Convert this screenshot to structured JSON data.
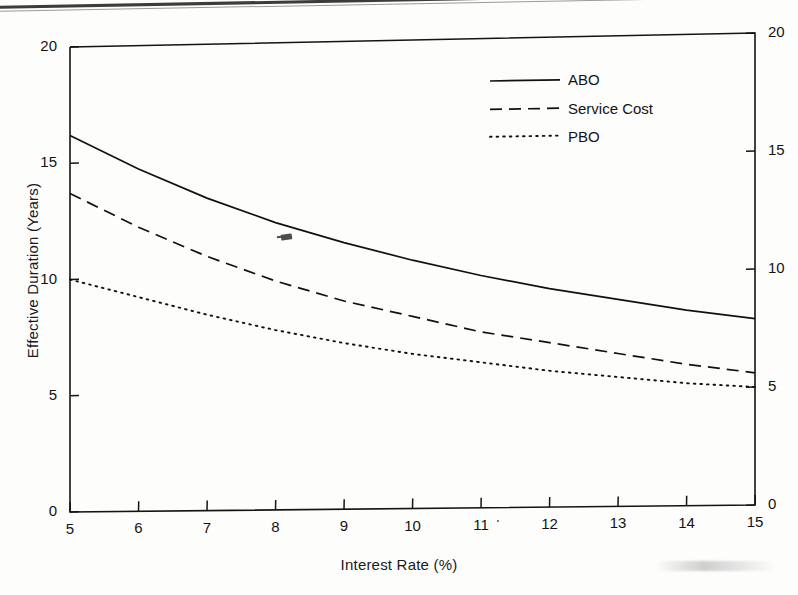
{
  "chart_data": {
    "type": "line",
    "title": "",
    "xlabel": "Interest Rate (%)",
    "ylabel": "Effective Duration (Years)",
    "xlim": [
      5,
      15
    ],
    "ylim": [
      0,
      20
    ],
    "xticks": [
      "5",
      "6",
      "7",
      "8",
      "9",
      "10",
      "11",
      "12",
      "13",
      "14",
      "15"
    ],
    "yticks": [
      "0",
      "5",
      "10",
      "15",
      "20"
    ],
    "yticks_right": [
      "0",
      "5",
      "10",
      "15",
      "20"
    ],
    "grid": false,
    "legend_position": "top-right",
    "x": [
      5,
      6,
      7,
      8,
      9,
      10,
      11,
      12,
      13,
      14,
      15
    ],
    "series": [
      {
        "name": "ABO",
        "style": "solid",
        "color": "#111111",
        "values": [
          16.2,
          14.7,
          13.4,
          12.3,
          11.4,
          10.6,
          9.9,
          9.3,
          8.8,
          8.3,
          7.9
        ]
      },
      {
        "name": "Service Cost",
        "style": "dashed",
        "color": "#111111",
        "values": [
          13.7,
          12.2,
          10.9,
          9.8,
          8.9,
          8.2,
          7.5,
          7.0,
          6.5,
          6.0,
          5.6
        ]
      },
      {
        "name": "PBO",
        "style": "dotted",
        "color": "#111111",
        "values": [
          10.0,
          9.2,
          8.4,
          7.7,
          7.1,
          6.6,
          6.2,
          5.8,
          5.5,
          5.2,
          5.0
        ]
      }
    ]
  },
  "legend": {
    "items": [
      {
        "label": "ABO"
      },
      {
        "label": "Service Cost"
      },
      {
        "label": "PBO"
      }
    ]
  },
  "axes": {
    "x_title": "Interest Rate (%)",
    "y_title": "Effective Duration (Years)"
  }
}
